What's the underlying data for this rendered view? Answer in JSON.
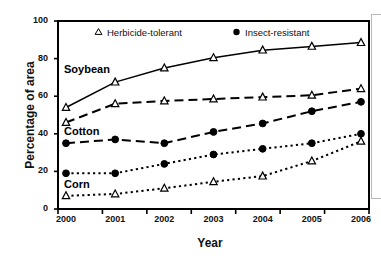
{
  "chart_data": {
    "type": "line",
    "title": "",
    "xlabel": "Year",
    "ylabel": "Percentage of area",
    "categories": [
      "2000",
      "2001",
      "2002",
      "2003",
      "2004",
      "2005",
      "2006"
    ],
    "x": [
      2000,
      2001,
      2002,
      2003,
      2004,
      2005,
      2006
    ],
    "ylim": [
      0,
      100
    ],
    "yticks": [
      0,
      20,
      40,
      60,
      80,
      100
    ],
    "grid": false,
    "legend_position": "top-inside",
    "legend": [
      {
        "label": "Herbicide-tolerant",
        "marker": "open-triangle"
      },
      {
        "label": "Insect-resistant",
        "marker": "filled-circle"
      }
    ],
    "annotations": [
      {
        "text": "Soybean",
        "x": 2000,
        "y": 74
      },
      {
        "text": "Cotton",
        "x": 2000,
        "y": 41
      },
      {
        "text": "Corn",
        "x": 2000,
        "y": 13
      }
    ],
    "series": [
      {
        "name": "Soybean Herbicide-tolerant",
        "crop": "Soybean",
        "trait": "Herbicide-tolerant",
        "marker": "open-triangle",
        "linestyle": "solid",
        "values": [
          54,
          67.5,
          75,
          80.5,
          84.5,
          86.5,
          88.5
        ]
      },
      {
        "name": "Cotton Herbicide-tolerant",
        "crop": "Cotton",
        "trait": "Herbicide-tolerant",
        "marker": "open-triangle",
        "linestyle": "long-dash",
        "values": [
          46,
          56,
          57.5,
          58.5,
          59.5,
          60.5,
          64
        ]
      },
      {
        "name": "Cotton Insect-resistant",
        "crop": "Cotton",
        "trait": "Insect-resistant",
        "marker": "filled-circle",
        "linestyle": "long-dash",
        "values": [
          35,
          37,
          35,
          41,
          45.5,
          52,
          57
        ]
      },
      {
        "name": "Corn Insect-resistant",
        "crop": "Corn",
        "trait": "Insect-resistant",
        "marker": "filled-circle",
        "linestyle": "dotted",
        "values": [
          19,
          19,
          24,
          29,
          32,
          35,
          40
        ]
      },
      {
        "name": "Corn Herbicide-tolerant",
        "crop": "Corn",
        "trait": "Herbicide-tolerant",
        "marker": "open-triangle",
        "linestyle": "dotted",
        "values": [
          7,
          8,
          11,
          14.5,
          17.5,
          25.5,
          36
        ]
      }
    ]
  },
  "colors": {
    "line": "#000000",
    "text": "#111111",
    "background": "#ffffff",
    "frame": "#000000"
  }
}
